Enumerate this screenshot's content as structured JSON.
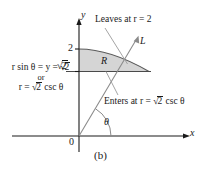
{
  "figure": {
    "caption": "(b)",
    "axes": {
      "y_label": "y",
      "x_label": "x",
      "origin_label": "0",
      "ticks": [
        {
          "name": "two",
          "text": "2"
        },
        {
          "name": "sqrt-two",
          "prefix": "√",
          "overline": "2"
        }
      ]
    },
    "region": {
      "label": "R",
      "fill_color": "#d5d5d5",
      "stroke_color": "#555555"
    },
    "ray": {
      "label": "L",
      "angle_label": "θ",
      "color": "#8a8a8a"
    },
    "annotations": [
      {
        "name": "leaves",
        "text": "Leaves at r = 2"
      },
      {
        "name": "enters",
        "prefix": "Enters at r = ",
        "radical": "√",
        "radicand": "2",
        "suffix": " csc θ"
      },
      {
        "name": "boundary-left",
        "line1_prefix": "r sin θ = y = ",
        "line1_radical": "√",
        "line1_radicand": "2",
        "line2": "or",
        "line3_prefix": "r = ",
        "line3_radical": "√",
        "line3_radicand": "2",
        "line3_suffix": " csc θ"
      }
    ],
    "colors": {
      "axis": "#1a1a1a",
      "leader": "#9a9a9a",
      "shade": "#d5d5d5"
    }
  }
}
